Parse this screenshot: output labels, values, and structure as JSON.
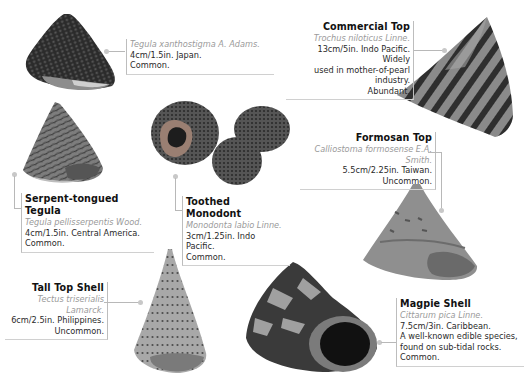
{
  "shells": [
    {
      "id": "tegula-xanthostigma",
      "title": "",
      "latin": "Tegula xanthostigma A. Adams.",
      "details": [
        "4cm/1.5in. Japan.",
        "Common."
      ]
    },
    {
      "id": "commercial-top",
      "title": "Commercial Top",
      "latin": "Trochus niloticus Linne.",
      "details": [
        "13cm/5in. Indo Pacific. Widely",
        "used in mother-of-pearl",
        "industry.",
        "Abundant."
      ]
    },
    {
      "id": "serpent-tongued-tegula",
      "title": "Serpent-tongued Tegula",
      "latin": "Tegula pellisserpentis Wood.",
      "details": [
        "4cm/1.5in. Central America.",
        "Common."
      ]
    },
    {
      "id": "toothed-monodont",
      "title": "Toothed Monodont",
      "latin": "Monodonta labio Linne.",
      "details": [
        "3cm/1.25in. Indo Pacific.",
        "Common."
      ]
    },
    {
      "id": "formosan-top",
      "title": "Formosan Top",
      "latin": "Calliostoma formosense E.A. Smith.",
      "details": [
        "5.5cm/2.25in. Taiwan.",
        "Uncommon."
      ]
    },
    {
      "id": "tall-top-shell",
      "title": "Tall Top Shell",
      "latin": "Tectus triserialis Lamarck.",
      "details": [
        "6cm/2.5in. Philippines.",
        "Uncommon."
      ]
    },
    {
      "id": "magpie-shell",
      "title": "Magpie Shell",
      "latin": "Cittarum pica Linne.",
      "details": [
        "7.5cm/3in. Caribbean.",
        "A well-known edible species,",
        "found on sub-tidal rocks.",
        "Common."
      ]
    }
  ],
  "colors": {
    "background": "#ffffff",
    "latin_text": "#9a9a9a",
    "connector": "#b8b8b8"
  }
}
